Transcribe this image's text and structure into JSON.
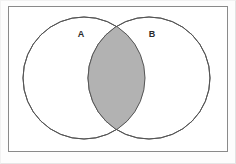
{
  "figure": {
    "type": "venn-diagram",
    "title": "",
    "background_color": "#fdfdfd",
    "universal_set_box": {
      "name": "universal-set-rectangle",
      "x": 8,
      "y": 6,
      "width": 220,
      "height": 146,
      "stroke_color": "#8a8a8a",
      "fill_color": "#ffffff",
      "stroke_width": 1
    },
    "circles": [
      {
        "id": "A",
        "label": "A",
        "cx": 84,
        "cy": 78,
        "r": 61,
        "stroke_color": "#555555",
        "fill_color": "#ffffff",
        "label_x": 81,
        "label_y": 35
      },
      {
        "id": "B",
        "label": "B",
        "cx": 149,
        "cy": 78,
        "r": 61,
        "stroke_color": "#555555",
        "fill_color": "#ffffff",
        "label_x": 152,
        "label_y": 35
      }
    ],
    "shaded_region": {
      "name": "intersection-A-and-B",
      "description": "A intersect B",
      "fill_color": "#b2b2b2",
      "stroke_color": "#555555"
    },
    "colors": {
      "outline": "#555555",
      "frame": "#8a8a8a",
      "shade": "#b2b2b2",
      "label": "#2b2b2b",
      "page": "#fdfdfd"
    }
  }
}
